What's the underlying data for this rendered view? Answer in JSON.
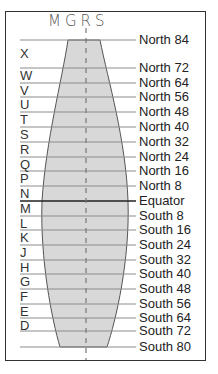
{
  "title": "MGRS",
  "colors": {
    "frame": "#333333",
    "fill": "#d8d8d8",
    "grid_line": "#8c8c8c",
    "equator_line": "#222222",
    "center_dash": "#777777",
    "text": "#222222"
  },
  "latitude_lines": [
    {
      "label": "North 84",
      "y": 40
    },
    {
      "label": "North 72",
      "y": 68
    },
    {
      "label": "North 64",
      "y": 83
    },
    {
      "label": "North 56",
      "y": 97
    },
    {
      "label": "North 48",
      "y": 112
    },
    {
      "label": "North 40",
      "y": 127
    },
    {
      "label": "North 32",
      "y": 142
    },
    {
      "label": "North 24",
      "y": 157
    },
    {
      "label": "North 16",
      "y": 171
    },
    {
      "label": "North 8",
      "y": 186
    },
    {
      "label": "Equator",
      "y": 201
    },
    {
      "label": "South 8",
      "y": 216
    },
    {
      "label": "South 16",
      "y": 230
    },
    {
      "label": "South 24",
      "y": 245
    },
    {
      "label": "South 32",
      "y": 260
    },
    {
      "label": "South 40",
      "y": 274
    },
    {
      "label": "South 48",
      "y": 289
    },
    {
      "label": "South 56",
      "y": 304
    },
    {
      "label": "South 64",
      "y": 318
    },
    {
      "label": "South 72",
      "y": 331
    },
    {
      "label": "South 80",
      "y": 347
    }
  ],
  "zone_letters": [
    {
      "letter": "X",
      "y": 47
    },
    {
      "letter": "W",
      "y": 69
    },
    {
      "letter": "V",
      "y": 84
    },
    {
      "letter": "U",
      "y": 98
    },
    {
      "letter": "T",
      "y": 113
    },
    {
      "letter": "S",
      "y": 128
    },
    {
      "letter": "R",
      "y": 143
    },
    {
      "letter": "Q",
      "y": 158
    },
    {
      "letter": "P",
      "y": 172
    },
    {
      "letter": "N",
      "y": 187
    },
    {
      "letter": "M",
      "y": 202
    },
    {
      "letter": "L",
      "y": 217
    },
    {
      "letter": "K",
      "y": 231
    },
    {
      "letter": "J",
      "y": 246
    },
    {
      "letter": "H",
      "y": 261
    },
    {
      "letter": "G",
      "y": 275
    },
    {
      "letter": "F",
      "y": 290
    },
    {
      "letter": "E",
      "y": 305
    },
    {
      "letter": "D",
      "y": 319
    }
  ]
}
